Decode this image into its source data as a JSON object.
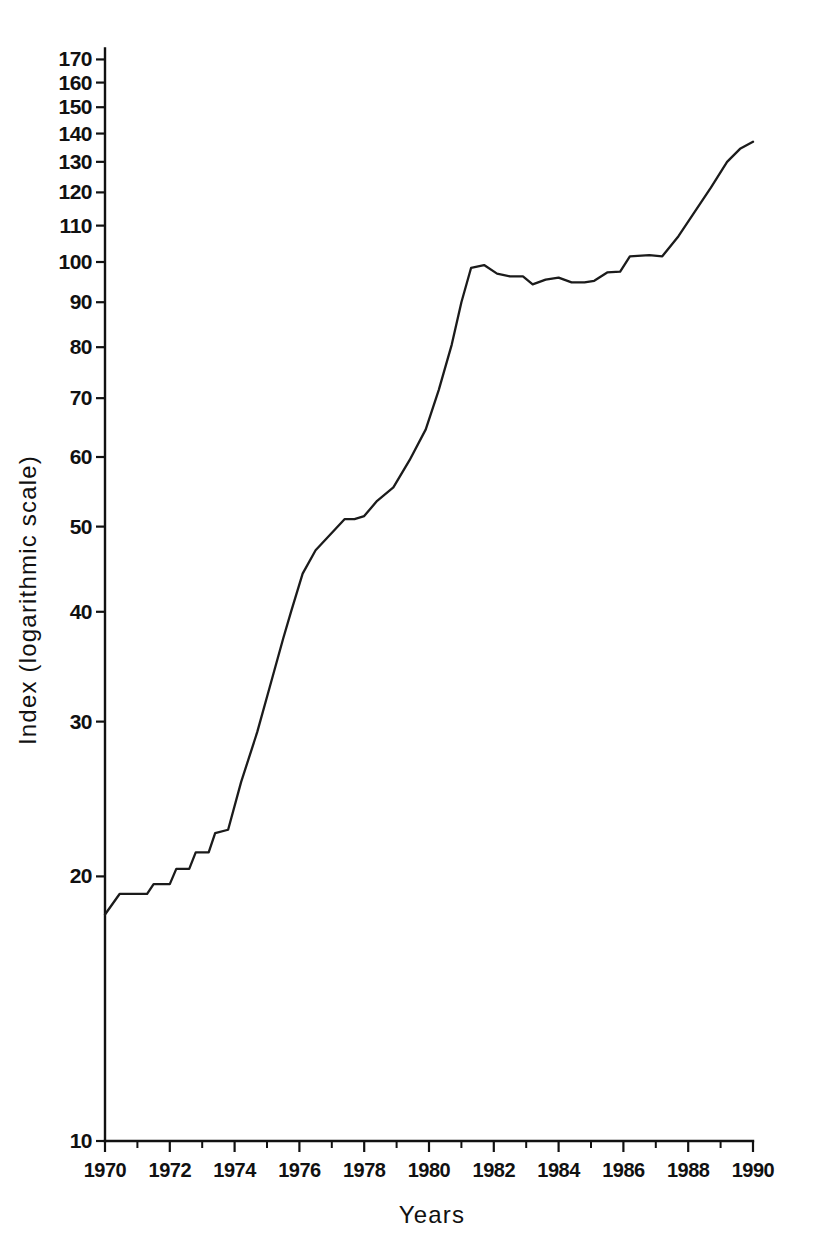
{
  "chart_data": {
    "type": "line",
    "title": "",
    "subtitle": "",
    "xlabel": "Years",
    "ylabel": "Index (logarithmic scale)",
    "yscale": "log",
    "ylim": [
      10,
      175
    ],
    "xlim": [
      1970,
      1990
    ],
    "grid": false,
    "legend": null,
    "line_color": "#1b1b1b",
    "background_color": "#ffffff",
    "y_ticks": [
      10,
      20,
      30,
      40,
      50,
      60,
      70,
      80,
      90,
      100,
      110,
      120,
      130,
      140,
      150,
      160,
      170
    ],
    "y_tick_labels": [
      "10",
      "20",
      "30",
      "40",
      "50",
      "60",
      "70",
      "80",
      "90",
      "100",
      "110",
      "120",
      "130",
      "140",
      "150",
      "160",
      "170"
    ],
    "x_ticks": [
      1970,
      1972,
      1974,
      1976,
      1978,
      1980,
      1982,
      1984,
      1986,
      1988,
      1990
    ],
    "x_tick_labels": [
      "1970",
      "1972",
      "1974",
      "1976",
      "1978",
      "1980",
      "1982",
      "1984",
      "1986",
      "1988",
      "1990"
    ],
    "x_minor_ticks": [
      1971,
      1973,
      1975,
      1977,
      1979,
      1981,
      1983,
      1985,
      1987,
      1989
    ],
    "series": [
      {
        "name": "Index",
        "x": [
          1970.0,
          1970.45,
          1971.3,
          1971.5,
          1972.0,
          1972.2,
          1972.6,
          1972.8,
          1973.2,
          1973.4,
          1973.8,
          1974.2,
          1974.7,
          1975.1,
          1975.5,
          1975.75,
          1976.1,
          1976.5,
          1977.4,
          1977.7,
          1978.0,
          1978.4,
          1978.9,
          1979.4,
          1979.9,
          1980.3,
          1980.7,
          1981.0,
          1981.3,
          1981.7,
          1982.1,
          1982.5,
          1982.9,
          1983.2,
          1983.6,
          1984.0,
          1984.4,
          1984.8,
          1985.1,
          1985.5,
          1985.9,
          1986.2,
          1986.8,
          1987.2,
          1987.7,
          1988.2,
          1988.7,
          1989.2,
          1989.6,
          1990.0
        ],
        "y": [
          18.1,
          19.1,
          19.1,
          19.6,
          19.6,
          20.4,
          20.4,
          21.3,
          21.3,
          22.4,
          22.6,
          25.6,
          29.2,
          33.0,
          37.3,
          40.1,
          44.2,
          47.0,
          51.0,
          51.0,
          51.4,
          53.5,
          55.4,
          59.5,
          64.5,
          71.5,
          80.5,
          90.0,
          98.5,
          99.2,
          97.0,
          96.3,
          96.3,
          94.3,
          95.5,
          96.0,
          94.8,
          94.8,
          95.2,
          97.3,
          97.5,
          101.5,
          101.8,
          101.5,
          107.0,
          114.0,
          121.5,
          130.0,
          134.5,
          137.0
        ]
      }
    ]
  },
  "axes": {
    "y_axis_name": "index-axis",
    "x_axis_name": "years-axis"
  }
}
